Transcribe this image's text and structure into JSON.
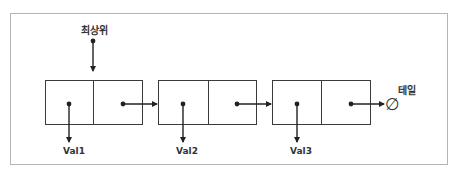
{
  "diagram": {
    "type": "singly-linked-list",
    "head_label": "최상위",
    "tail_label": "테일",
    "null_symbol": "∅",
    "nodes": [
      {
        "value_label": "Val1"
      },
      {
        "value_label": "Val2"
      },
      {
        "value_label": "Val3"
      }
    ],
    "colors": {
      "frame_border": "#b5b5b5",
      "line": "#222222",
      "text": "#333333"
    }
  }
}
